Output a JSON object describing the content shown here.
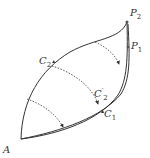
{
  "diagram": {
    "type": "curve-deformation-figure",
    "labels": {
      "A": {
        "text": "A",
        "sub": ""
      },
      "P2": {
        "text": "P",
        "sub": "2"
      },
      "P1": {
        "text": "P",
        "sub": "1"
      },
      "C2": {
        "text": "C",
        "sub": "2"
      },
      "C2prime": {
        "text": "C",
        "sub": "2",
        "prime": "′"
      },
      "C1": {
        "text": "C",
        "sub": "1"
      }
    },
    "colors": {
      "stroke": "#333333",
      "background": "#ffffff"
    }
  }
}
